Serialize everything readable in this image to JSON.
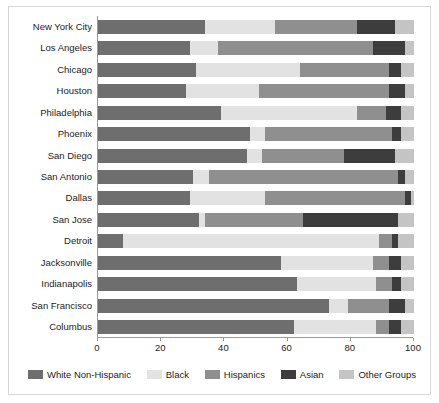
{
  "chart_data": {
    "type": "bar",
    "subtype": "stacked-horizontal-bar",
    "title": "",
    "xlabel": "",
    "ylabel": "",
    "xlim": [
      0,
      100
    ],
    "xticks": [
      0,
      20,
      40,
      60,
      80,
      100
    ],
    "xtick_labels": [
      "0",
      "20",
      "40",
      "60",
      "80",
      "100"
    ],
    "grid": false,
    "legend_position": "bottom",
    "stacked": true,
    "categories": [
      "New York City",
      "Los Angeles",
      "Chicago",
      "Houston",
      "Philadelphia",
      "Phoenix",
      "San Diego",
      "San Antonio",
      "Dallas",
      "San Jose",
      "Detroit",
      "Jacksonville",
      "Indianapolis",
      "San Francisco",
      "Columbus"
    ],
    "series": [
      {
        "name": "White Non-Hispanic",
        "color": "#6e6e6e",
        "values": [
          34,
          29,
          31,
          28,
          39,
          48,
          47,
          30,
          29,
          32,
          8,
          58,
          63,
          73,
          62
        ]
      },
      {
        "name": "Black",
        "color": "#e2e2e2",
        "values": [
          22,
          9,
          33,
          23,
          43,
          5,
          5,
          5,
          24,
          2,
          81,
          29,
          25,
          6,
          26
        ]
      },
      {
        "name": "Hispanics",
        "color": "#8f8f8f",
        "values": [
          26,
          49,
          28,
          41,
          9,
          40,
          26,
          60,
          44,
          31,
          4,
          5,
          5,
          13,
          4
        ]
      },
      {
        "name": "Asian",
        "color": "#3d3d3d",
        "values": [
          12,
          10,
          4,
          5,
          5,
          3,
          16,
          2,
          2,
          30,
          2,
          4,
          3,
          5,
          4
        ]
      },
      {
        "name": "Other Groups",
        "color": "#c4c4c4",
        "values": [
          6,
          3,
          4,
          3,
          4,
          4,
          6,
          3,
          1,
          5,
          5,
          4,
          4,
          3,
          4
        ]
      }
    ]
  },
  "legend": {
    "items": [
      {
        "label": "White Non-Hispanic",
        "color": "#6e6e6e",
        "swatch": "legend-swatch-white-non-hispanic"
      },
      {
        "label": "Black",
        "color": "#e2e2e2",
        "swatch": "legend-swatch-black"
      },
      {
        "label": "Hispanics",
        "color": "#8f8f8f",
        "swatch": "legend-swatch-hispanics"
      },
      {
        "label": "Asian",
        "color": "#3d3d3d",
        "swatch": "legend-swatch-asian"
      },
      {
        "label": "Other Groups",
        "color": "#c4c4c4",
        "swatch": "legend-swatch-other-groups"
      }
    ]
  },
  "axis": {
    "x_tick_labels": [
      "0",
      "20",
      "40",
      "60",
      "80",
      "100"
    ]
  }
}
